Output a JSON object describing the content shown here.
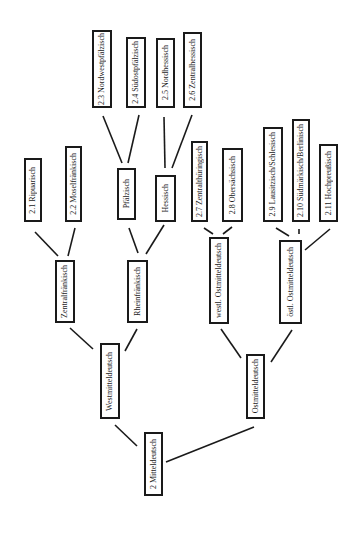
{
  "diagram": {
    "type": "tree",
    "orientation": "rotated 90° (text reads bottom-to-top)",
    "nodes": [
      {
        "id": "mitteldeutsch",
        "label": "2 Mitteldeutsch",
        "x": 144,
        "y": 432,
        "w": 19,
        "h": 64
      },
      {
        "id": "westmitteldeutsch",
        "label": "Westmitteldeutsch",
        "x": 100,
        "y": 343,
        "w": 20,
        "h": 76
      },
      {
        "id": "ostmitteldeutsch",
        "label": "Ostmitteldeutsch",
        "x": 246,
        "y": 354,
        "w": 19,
        "h": 65
      },
      {
        "id": "zentralfraenkisch",
        "label": "Zentralfränkisch",
        "x": 55,
        "y": 260,
        "w": 20,
        "h": 63
      },
      {
        "id": "rheinfraenkisch",
        "label": "Rheinfränkisch",
        "x": 127,
        "y": 260,
        "w": 21,
        "h": 63
      },
      {
        "id": "westl_omd",
        "label": "westl. Ostmitteldeutsch",
        "x": 209,
        "y": 237,
        "w": 20,
        "h": 87
      },
      {
        "id": "oestl_omd",
        "label": "östl. Ostmitteldeutsch",
        "x": 279,
        "y": 240,
        "w": 23,
        "h": 84
      },
      {
        "id": "ripuarisch",
        "label": "2.1 Ripuarisch",
        "x": 24,
        "y": 158,
        "w": 18,
        "h": 64
      },
      {
        "id": "moselfraenkisch",
        "label": "2.2 Moselfränkisch",
        "x": 65,
        "y": 146,
        "w": 17,
        "h": 76
      },
      {
        "id": "pfaelzisch",
        "label": "Pfälzisch",
        "x": 117,
        "y": 168,
        "w": 19,
        "h": 52
      },
      {
        "id": "hessisch",
        "label": "Hessisch",
        "x": 155,
        "y": 175,
        "w": 21,
        "h": 47
      },
      {
        "id": "nordwestpfaelzisch",
        "label": "2.3 Nordwestpfälzisch",
        "x": 92,
        "y": 30,
        "w": 20,
        "h": 78
      },
      {
        "id": "suedostpfaelzisch",
        "label": "2.4 Südostpfälzisch",
        "x": 126,
        "y": 37,
        "w": 20,
        "h": 71
      },
      {
        "id": "nordhessisch",
        "label": "2.5 Nordhessisch",
        "x": 156,
        "y": 38,
        "w": 19,
        "h": 70
      },
      {
        "id": "zentralhessisch",
        "label": "2.6 Zentralhessisch",
        "x": 183,
        "y": 32,
        "w": 19,
        "h": 76
      },
      {
        "id": "zentralthueringisch",
        "label": "2.7 Zentralthüringisch",
        "x": 191,
        "y": 141,
        "w": 17,
        "h": 81
      },
      {
        "id": "obersaechsisch",
        "label": "2.8 Obersächsisch",
        "x": 222,
        "y": 148,
        "w": 21,
        "h": 74
      },
      {
        "id": "lausitzisch",
        "label": "2.9 Lausitzisch/Schlesisch",
        "x": 263,
        "y": 127,
        "w": 20,
        "h": 95
      },
      {
        "id": "suedmaerkisch",
        "label": "2.10 Südmärkisch/Berlinisch",
        "x": 292,
        "y": 119,
        "w": 18,
        "h": 103
      },
      {
        "id": "hochpreussisch",
        "label": "2.11 Hochpreußisch",
        "x": 319,
        "y": 144,
        "w": 19,
        "h": 78
      }
    ],
    "edges": [
      {
        "from": "mitteldeutsch",
        "to": "westmitteldeutsch",
        "x1": 137,
        "y1": 446,
        "x2": 115,
        "y2": 425
      },
      {
        "from": "mitteldeutsch",
        "to": "ostmitteldeutsch",
        "x1": 166,
        "y1": 462,
        "x2": 254,
        "y2": 427
      },
      {
        "from": "westmitteldeutsch",
        "to": "zentralfraenkisch",
        "x1": 93,
        "y1": 349,
        "x2": 70,
        "y2": 328
      },
      {
        "from": "westmitteldeutsch",
        "to": "rheinfraenkisch",
        "x1": 125,
        "y1": 351,
        "x2": 137,
        "y2": 329
      },
      {
        "from": "ostmitteldeutsch",
        "to": "westl_omd",
        "x1": 241,
        "y1": 358,
        "x2": 221,
        "y2": 329
      },
      {
        "from": "ostmitteldeutsch",
        "to": "oestl_omd",
        "x1": 271,
        "y1": 362,
        "x2": 292,
        "y2": 330
      },
      {
        "from": "zentralfraenkisch",
        "to": "ripuarisch",
        "x1": 58,
        "y1": 256,
        "x2": 35,
        "y2": 232
      },
      {
        "from": "zentralfraenkisch",
        "to": "moselfraenkisch",
        "x1": 68,
        "y1": 256,
        "x2": 75,
        "y2": 228
      },
      {
        "from": "rheinfraenkisch",
        "to": "pfaelzisch",
        "x1": 138,
        "y1": 253,
        "x2": 129,
        "y2": 228
      },
      {
        "from": "rheinfraenkisch",
        "to": "hessisch",
        "x1": 146,
        "y1": 254,
        "x2": 164,
        "y2": 225
      },
      {
        "from": "pfaelzisch",
        "to": "nordwestpfaelzisch",
        "x1": 122,
        "y1": 163,
        "x2": 103,
        "y2": 116
      },
      {
        "from": "pfaelzisch",
        "to": "suedostpfaelzisch",
        "x1": 128,
        "y1": 163,
        "x2": 139,
        "y2": 115
      },
      {
        "from": "hessisch",
        "to": "nordhessisch",
        "x1": 165,
        "y1": 168,
        "x2": 164,
        "y2": 117
      },
      {
        "from": "hessisch",
        "to": "zentralhessisch",
        "x1": 172,
        "y1": 168,
        "x2": 192,
        "y2": 115
      },
      {
        "from": "westl_omd",
        "to": "zentralthueringisch",
        "x1": 213,
        "y1": 234,
        "x2": 204,
        "y2": 228
      },
      {
        "from": "westl_omd",
        "to": "obersaechsisch",
        "x1": 223,
        "y1": 234,
        "x2": 232,
        "y2": 227
      },
      {
        "from": "oestl_omd",
        "to": "lausitzisch",
        "x1": 289,
        "y1": 236,
        "x2": 276,
        "y2": 228
      },
      {
        "from": "oestl_omd",
        "to": "suedmaerkisch",
        "x1": 299,
        "y1": 234,
        "x2": 299,
        "y2": 229
      },
      {
        "from": "oestl_omd",
        "to": "hochpreussisch",
        "x1": 305,
        "y1": 250,
        "x2": 330,
        "y2": 229
      }
    ]
  }
}
